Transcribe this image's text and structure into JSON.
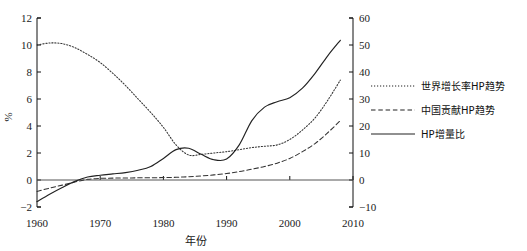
{
  "chart_data": {
    "type": "line",
    "title": "",
    "xlabel": "年份",
    "ylabel": "%",
    "y2label": "",
    "xlim": [
      1960,
      2010
    ],
    "ylim": [
      -2,
      12
    ],
    "y2lim": [
      -10,
      60
    ],
    "grid": false,
    "legend_position": "right",
    "xticks": [
      "1960",
      "1970",
      "1980",
      "1990",
      "2000",
      "2010"
    ],
    "xtick_values": [
      1960,
      1970,
      1980,
      1990,
      2000,
      2010
    ],
    "yticks": [
      "12",
      "10",
      "8",
      "6",
      "4",
      "2",
      "0",
      "-2"
    ],
    "ytick_values": [
      12,
      10,
      8,
      6,
      4,
      2,
      0,
      -2
    ],
    "y2ticks": [
      "60",
      "50",
      "40",
      "30",
      "20",
      "10",
      "0",
      "-10"
    ],
    "y2tick_values": [
      60,
      50,
      40,
      30,
      20,
      10,
      0,
      -10
    ],
    "x": [
      1960,
      1962,
      1964,
      1966,
      1968,
      1970,
      1972,
      1974,
      1976,
      1978,
      1980,
      1982,
      1984,
      1986,
      1988,
      1990,
      1992,
      1994,
      1996,
      1998,
      2000,
      2002,
      2004,
      2006,
      2008
    ],
    "series": [
      {
        "name": "世界增长率HP趋势",
        "style": "dotted",
        "axis": "left",
        "color": "#333333",
        "values": [
          10.0,
          10.15,
          10.1,
          9.8,
          9.3,
          8.7,
          7.9,
          7.0,
          6.0,
          5.0,
          3.9,
          2.6,
          1.85,
          1.9,
          2.0,
          2.1,
          2.25,
          2.4,
          2.5,
          2.6,
          3.0,
          3.7,
          4.6,
          5.9,
          7.4
        ]
      },
      {
        "name": "中国贡献HP趋势",
        "style": "dashed",
        "axis": "left",
        "color": "#333333",
        "values": [
          -0.85,
          -0.6,
          -0.38,
          -0.15,
          0.05,
          0.12,
          0.14,
          0.15,
          0.16,
          0.17,
          0.18,
          0.2,
          0.24,
          0.3,
          0.38,
          0.48,
          0.62,
          0.8,
          1.0,
          1.25,
          1.6,
          2.1,
          2.7,
          3.5,
          4.4
        ]
      },
      {
        "name": "HP增量比",
        "style": "solid",
        "axis": "left",
        "color": "#222222",
        "values": [
          -1.6,
          -1.05,
          -0.55,
          -0.1,
          0.22,
          0.35,
          0.45,
          0.55,
          0.72,
          1.0,
          1.6,
          2.25,
          2.35,
          1.9,
          1.5,
          1.55,
          2.6,
          4.4,
          5.4,
          5.8,
          6.1,
          6.8,
          7.9,
          9.2,
          10.35
        ]
      }
    ]
  },
  "legend": {
    "items": [
      {
        "label": "世界增长率HP趋势",
        "style": "dotted"
      },
      {
        "label": "中国贡献HP趋势",
        "style": "dashed"
      },
      {
        "label": "HP增量比",
        "style": "solid"
      }
    ]
  },
  "axes": {
    "left_title": "%",
    "bottom_title": "年份"
  }
}
